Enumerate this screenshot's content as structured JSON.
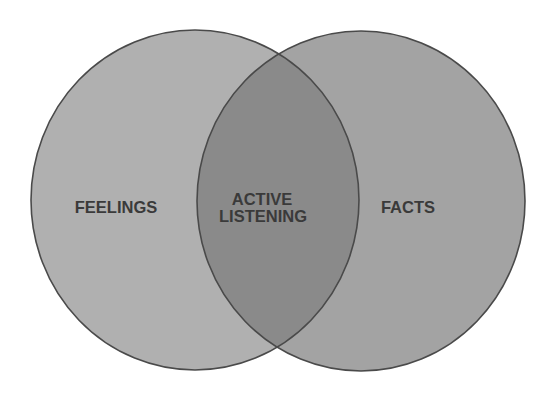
{
  "diagram": {
    "type": "venn",
    "sets": [
      {
        "id": "left",
        "label": "FEELINGS",
        "color": "#b0b0b0"
      },
      {
        "id": "right",
        "label": "FACTS",
        "color": "#a3a3a3"
      }
    ],
    "intersection": {
      "line1": "ACTIVE",
      "line2": "LISTENING",
      "color": "#8a8a8a"
    },
    "stroke_color": "#4a4a4a",
    "text_color": "#3a3a3a"
  }
}
